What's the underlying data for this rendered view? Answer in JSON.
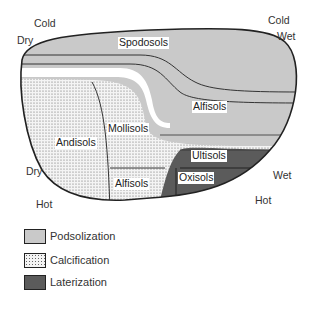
{
  "diagram": {
    "axis_labels": {
      "top_left_temp": "Cold",
      "top_left_moisture": "Dry",
      "top_right_temp": "Cold",
      "top_right_moisture": "Wet",
      "bottom_left_moisture": "Dry",
      "bottom_left_temp": "Hot",
      "bottom_right_moisture": "Wet",
      "bottom_right_temp": "Hot"
    },
    "soil_orders": {
      "spodosols": "Spodosols",
      "alfisols_upper": "Alfisols",
      "andisols": "Andisols",
      "mollisols": "Mollisols",
      "alfisols_lower": "Alfisols",
      "ultisols": "Ultisols",
      "oxisols": "Oxisols"
    },
    "colors": {
      "podsolization": "#c8c8c8",
      "calcification_bg": "#f2f2f2",
      "laterization": "#5a5a5a",
      "outline": "#222222"
    }
  },
  "legend": {
    "items": [
      {
        "label": "Podsolization",
        "pattern": "light-gray"
      },
      {
        "label": "Calcification",
        "pattern": "dotted"
      },
      {
        "label": "Laterization",
        "pattern": "dark-gray"
      }
    ]
  }
}
